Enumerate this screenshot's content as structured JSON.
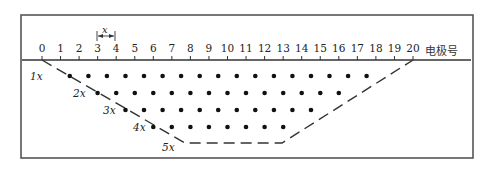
{
  "figure": {
    "axis_label": "电极号",
    "spacing_label": "x",
    "electrodes": [
      "0",
      "1",
      "2",
      "3",
      "4",
      "5",
      "6",
      "7",
      "8",
      "9",
      "10",
      "11",
      "12",
      "13",
      "14",
      "15",
      "16",
      "17",
      "18",
      "19",
      "20"
    ],
    "depth_levels": [
      {
        "label": "1x",
        "points": 17
      },
      {
        "label": "2x",
        "points": 14
      },
      {
        "label": "3x",
        "points": 11
      },
      {
        "label": "4x",
        "points": 8
      },
      {
        "label": "5x",
        "points": 0
      }
    ],
    "colors": {
      "line": "#333333",
      "dot": "#111111",
      "border": "#555555"
    }
  }
}
